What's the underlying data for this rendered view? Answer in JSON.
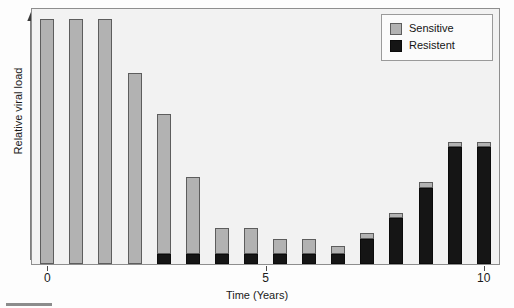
{
  "figure": {
    "background_color": "#f2f2f2",
    "frame_color": "#8e8e8e"
  },
  "axes": {
    "y_title": "Relative viral load",
    "x_title": "Time (Years)",
    "x_ticks": [
      {
        "value": 0,
        "label": "0"
      },
      {
        "value": 5,
        "label": "5"
      },
      {
        "value": 10,
        "label": "10"
      }
    ]
  },
  "legend": {
    "entries": [
      {
        "label": "Sensitive",
        "color": "#b2b2b2",
        "swatch": "sensitive"
      },
      {
        "label": "Resistent",
        "color": "#151515",
        "swatch": "resistent"
      }
    ]
  },
  "chart_data": {
    "type": "bar",
    "subtype": "stacked",
    "title": "",
    "xlabel": "Time (Years)",
    "ylabel": "Relative viral load",
    "xlim": [
      -0.35,
      10.35
    ],
    "ylim": [
      0,
      100
    ],
    "grid": false,
    "legend_position": "top-right",
    "x": [
      0,
      0.667,
      1.333,
      2,
      2.667,
      3.333,
      4,
      4.667,
      5.333,
      6,
      6.667,
      7.333,
      8,
      8.667,
      9.333,
      10
    ],
    "categories": [
      "0",
      "0.7",
      "1.3",
      "2",
      "2.7",
      "3.3",
      "4",
      "4.7",
      "5.3",
      "6",
      "6.7",
      "7.3",
      "8",
      "8.7",
      "9.3",
      "10"
    ],
    "series": [
      {
        "name": "Resistent",
        "color": "#151515",
        "values": [
          0,
          0,
          0,
          0,
          4,
          4,
          4,
          4,
          4,
          4,
          4,
          10,
          18,
          30,
          46,
          46
        ]
      },
      {
        "name": "Sensitive",
        "color": "#b2b2b2",
        "values": [
          96,
          96,
          96,
          75,
          55,
          30,
          10,
          10,
          6,
          6,
          3,
          2,
          2,
          2,
          2,
          2
        ]
      }
    ],
    "totals": [
      96,
      96,
      96,
      75,
      59,
      34,
      14,
      14,
      10,
      10,
      7,
      12,
      20,
      32,
      48,
      48
    ]
  },
  "artifacts": {
    "bleed_lines": [
      "interactions",
      "bacterial resistance"
    ]
  }
}
